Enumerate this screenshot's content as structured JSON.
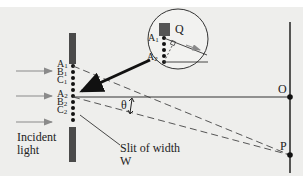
{
  "diagram": {
    "labels": {
      "A1": {
        "main": "A",
        "sub": "1"
      },
      "B1": {
        "main": "B",
        "sub": "1"
      },
      "C1": {
        "main": "C",
        "sub": "1"
      },
      "A2": {
        "main": "A",
        "sub": "2"
      },
      "B2": {
        "main": "B",
        "sub": "2"
      },
      "C2": {
        "main": "C",
        "sub": "2"
      },
      "inset_A1": {
        "main": "A",
        "sub": "1"
      },
      "inset_A2": {
        "main": "A",
        "sub": "2"
      },
      "Q": "Q",
      "O": "O",
      "P": "P",
      "theta": "θ",
      "incident_line1": "Incident",
      "incident_line2": "light",
      "slit_line1": "Slit of width",
      "slit_line2": "W"
    },
    "colors": {
      "background": "#eeeeec",
      "barrier": "#4a4a4a",
      "line": "#333333",
      "arrow": "#8a8a8a"
    }
  }
}
